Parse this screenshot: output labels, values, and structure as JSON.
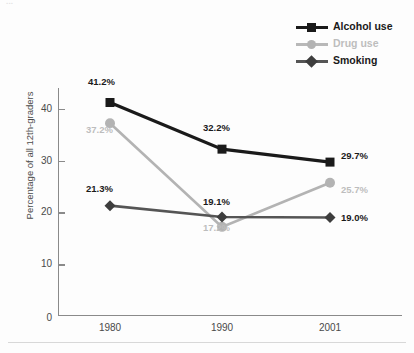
{
  "figure": {
    "top_caption": "...",
    "background": "#fdfdfd"
  },
  "legend": {
    "position": "top-right",
    "items": [
      {
        "label": "Alcohol use",
        "color": "#1a1a1a",
        "marker": "square"
      },
      {
        "label": "Drug use",
        "color": "#b3b3b3",
        "marker": "circle"
      },
      {
        "label": "Smoking",
        "color": "#555555",
        "marker": "diamond"
      }
    ]
  },
  "axes": {
    "ylabel": "Percentage of all 12th-graders",
    "yticks": [
      "0",
      "10",
      "20",
      "30",
      "40"
    ],
    "xticks": [
      "1980",
      "1990",
      "2001"
    ]
  },
  "chart_data": {
    "type": "line",
    "title": "",
    "xlabel": "",
    "ylabel": "Percentage of all 12th-graders",
    "categories": [
      "1980",
      "1990",
      "2001"
    ],
    "ylim": [
      0,
      44
    ],
    "grid": false,
    "legend_position": "top-right",
    "series": [
      {
        "name": "Alcohol use",
        "color": "#1a1a1a",
        "marker": "square",
        "values": [
          41.2,
          32.2,
          29.7
        ],
        "labels": [
          "41.2%",
          "32.2%",
          "29.7%"
        ]
      },
      {
        "name": "Drug use",
        "color": "#b3b3b3",
        "marker": "circle",
        "values": [
          37.2,
          17.2,
          25.7
        ],
        "labels": [
          "37.2%",
          "17.2%",
          "25.7%"
        ]
      },
      {
        "name": "Smoking",
        "color": "#555555",
        "marker": "diamond",
        "values": [
          21.3,
          19.1,
          19.0
        ],
        "labels": [
          "21.3%",
          "19.1%",
          "19.0%"
        ]
      }
    ]
  },
  "point_labels": {
    "alcohol_1980": "41.2%",
    "alcohol_1990": "32.2%",
    "alcohol_2001": "29.7%",
    "drug_1980": "37.2%",
    "drug_1990": "17.2%",
    "drug_2001": "25.7%",
    "smoking_1980": "21.3%",
    "smoking_1990": "19.1%",
    "smoking_2001": "19.0%"
  }
}
